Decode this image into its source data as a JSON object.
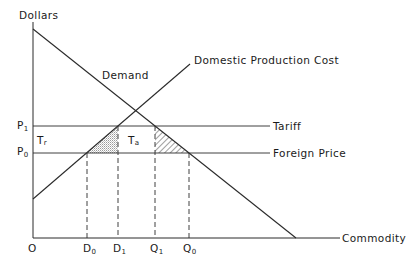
{
  "diagram": {
    "type": "economics-tariff-diagram",
    "y_axis_label": "Dollars",
    "x_axis_label": "Commodity",
    "origin_label": "O",
    "curves": {
      "demand": {
        "label": "Demand"
      },
      "supply": {
        "label": "Domestic Production Cost"
      }
    },
    "price_lines": {
      "tariff": {
        "label": "Tariff",
        "axis_label": "P",
        "axis_sub": "1"
      },
      "foreign": {
        "label": "Foreign Price",
        "axis_label": "P",
        "axis_sub": "0"
      }
    },
    "regions": {
      "tr": {
        "label": "T",
        "sub": "r"
      },
      "ta": {
        "label": "T",
        "sub": "a"
      }
    },
    "x_ticks": [
      {
        "label": "D",
        "sub": "0"
      },
      {
        "label": "D",
        "sub": "1"
      },
      {
        "label": "Q",
        "sub": "1"
      },
      {
        "label": "Q",
        "sub": "0"
      }
    ],
    "colors": {
      "line": "#2a2a2a",
      "shade": "#bdbdbd",
      "background": "#ffffff"
    }
  }
}
